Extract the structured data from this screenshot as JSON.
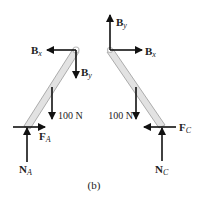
{
  "figure": {
    "caption": "(b)",
    "colors": {
      "bar_fill": "#e2e2e2",
      "bar_stroke": "#9a9a9a",
      "arrow": "#111111",
      "text": "#222222",
      "pin": "#bdbdbd"
    }
  },
  "left_member": {
    "pin_label": "B",
    "forces": {
      "bx": {
        "main": "B",
        "sub": "x"
      },
      "by": {
        "main": "B",
        "sub": "y"
      },
      "weight": "100 N",
      "fa": {
        "main": "F",
        "sub": "A"
      },
      "na": {
        "main": "N",
        "sub": "A"
      }
    }
  },
  "right_member": {
    "forces": {
      "bx": {
        "main": "B",
        "sub": "x"
      },
      "by": {
        "main": "B",
        "sub": "y"
      },
      "weight": "100 N",
      "fc": {
        "main": "F",
        "sub": "C"
      },
      "nc": {
        "main": "N",
        "sub": "C"
      }
    }
  }
}
